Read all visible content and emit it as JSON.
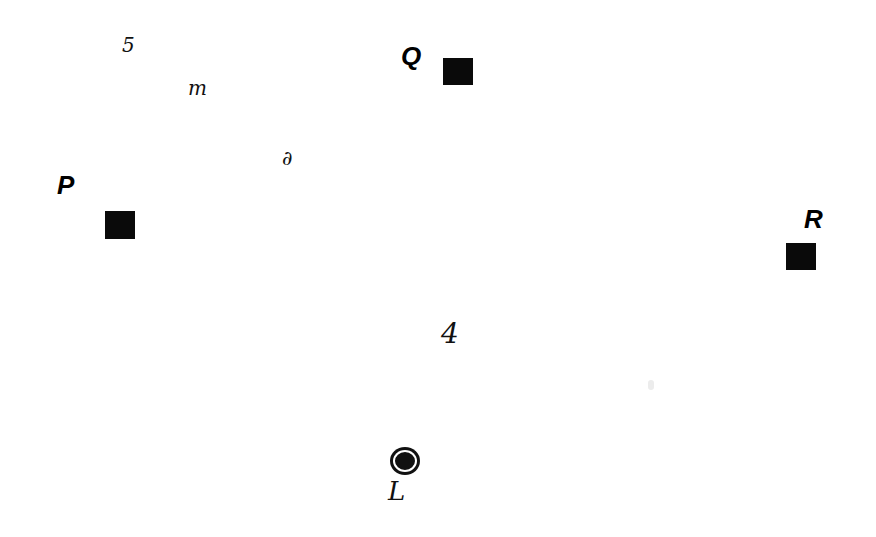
{
  "diagram": {
    "points": [
      {
        "id": "P",
        "label": "P",
        "label_x": 57,
        "label_y": 172,
        "square_x": 105,
        "square_y": 211,
        "size": 30
      },
      {
        "id": "Q",
        "label": "Q",
        "label_x": 401,
        "label_y": 43,
        "square_x": 443,
        "square_y": 58,
        "size": 30
      },
      {
        "id": "R",
        "label": "R",
        "label_x": 804,
        "label_y": 206,
        "square_x": 786,
        "square_y": 243,
        "size": 30
      }
    ],
    "handwritten_marks": [
      {
        "text": "5",
        "x": 122,
        "y": 37,
        "size": 20
      },
      {
        "text": "m",
        "x": 188,
        "y": 80,
        "size": 20
      },
      {
        "text": "∂",
        "x": 282,
        "y": 150,
        "size": 20
      },
      {
        "text": "4",
        "x": 441,
        "y": 322,
        "size": 28
      },
      {
        "text": "L",
        "x": 388,
        "y": 480,
        "size": 26
      }
    ],
    "marker": {
      "type": "filled-circle",
      "x": 393,
      "y": 450,
      "diameter": 24
    },
    "colors": {
      "background": "#ffffff",
      "ink": "#000000"
    }
  }
}
